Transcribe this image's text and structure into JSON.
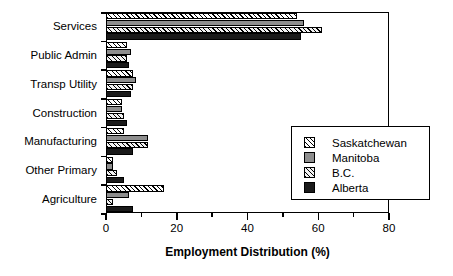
{
  "chart_data": {
    "type": "bar",
    "orientation": "horizontal",
    "title": "",
    "xlabel": "Employment Distribution (%)",
    "ylabel": "",
    "xlim": [
      0,
      80
    ],
    "xticks": [
      0,
      20,
      40,
      60,
      80
    ],
    "xtick_labels": [
      "0",
      "20",
      "40",
      "60",
      "80"
    ],
    "minor_xticks": [
      10,
      30,
      50,
      70
    ],
    "grid": false,
    "legend_position": "lower-right",
    "categories": [
      "Services",
      "Public Admin",
      "Transp Utility",
      "Construction",
      "Manufacturing",
      "Other Primary",
      "Agriculture"
    ],
    "series": [
      {
        "name": "Saskatchewan",
        "pattern": "white-diagonal-hatch",
        "color": "#ffffff",
        "values": [
          54.0,
          6.0,
          7.5,
          4.5,
          5.0,
          2.0,
          16.5
        ]
      },
      {
        "name": "Manitoba",
        "pattern": "solid-gray",
        "color": "#8e8e8e",
        "values": [
          56.0,
          7.0,
          8.5,
          4.5,
          12.0,
          2.0,
          6.5
        ]
      },
      {
        "name": "B.C.",
        "pattern": "gray-diagonal-hatch",
        "color": "#7d7d7d",
        "values": [
          61.0,
          6.0,
          7.5,
          5.0,
          12.0,
          3.0,
          2.0
        ]
      },
      {
        "name": "Alberta",
        "pattern": "solid-black",
        "color": "#1a1a1a",
        "values": [
          55.0,
          6.5,
          7.0,
          6.0,
          7.5,
          5.0,
          7.5
        ]
      }
    ]
  },
  "legend": {
    "entries": [
      {
        "label": "Saskatchewan",
        "swatch": "hatch-white-swatch"
      },
      {
        "label": "Manitoba",
        "swatch": "solid-gray-swatch"
      },
      {
        "label": "B.C.",
        "swatch": "hatch-gray-swatch"
      },
      {
        "label": "Alberta",
        "swatch": "solid-black-swatch"
      }
    ]
  }
}
